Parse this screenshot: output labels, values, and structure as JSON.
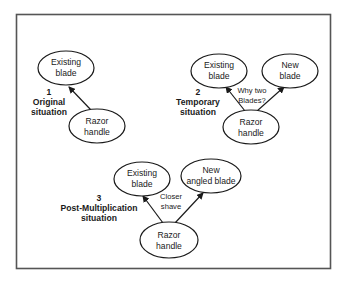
{
  "scenarios": [
    {
      "number": "1",
      "title_lines": [
        "Original",
        "situation"
      ],
      "nodes": [
        {
          "id": "existing",
          "lines": [
            "Existing",
            "blade"
          ]
        },
        {
          "id": "handle",
          "lines": [
            "Razor",
            "handle"
          ]
        }
      ],
      "edges": [
        {
          "from": "handle",
          "to": "existing"
        }
      ],
      "edge_note_lines": []
    },
    {
      "number": "2",
      "title_lines": [
        "Temporary",
        "situation"
      ],
      "nodes": [
        {
          "id": "existing",
          "lines": [
            "Existing",
            "blade"
          ]
        },
        {
          "id": "new",
          "lines": [
            "New",
            "blade"
          ]
        },
        {
          "id": "handle",
          "lines": [
            "Razor",
            "handle"
          ]
        }
      ],
      "edges": [
        {
          "from": "handle",
          "to": "existing"
        },
        {
          "from": "handle",
          "to": "new"
        }
      ],
      "edge_note_lines": [
        "Why two",
        "Blades?"
      ]
    },
    {
      "number": "3",
      "title_lines": [
        "Post-Multiplication",
        "situation"
      ],
      "nodes": [
        {
          "id": "existing",
          "lines": [
            "Existing",
            "blade"
          ]
        },
        {
          "id": "new",
          "lines": [
            "New",
            "angled blade"
          ]
        },
        {
          "id": "handle",
          "lines": [
            "Razor",
            "handle"
          ]
        }
      ],
      "edges": [
        {
          "from": "handle",
          "to": "existing"
        },
        {
          "from": "handle",
          "to": "new"
        }
      ],
      "edge_note_lines": [
        "Closer",
        "shave"
      ]
    }
  ]
}
